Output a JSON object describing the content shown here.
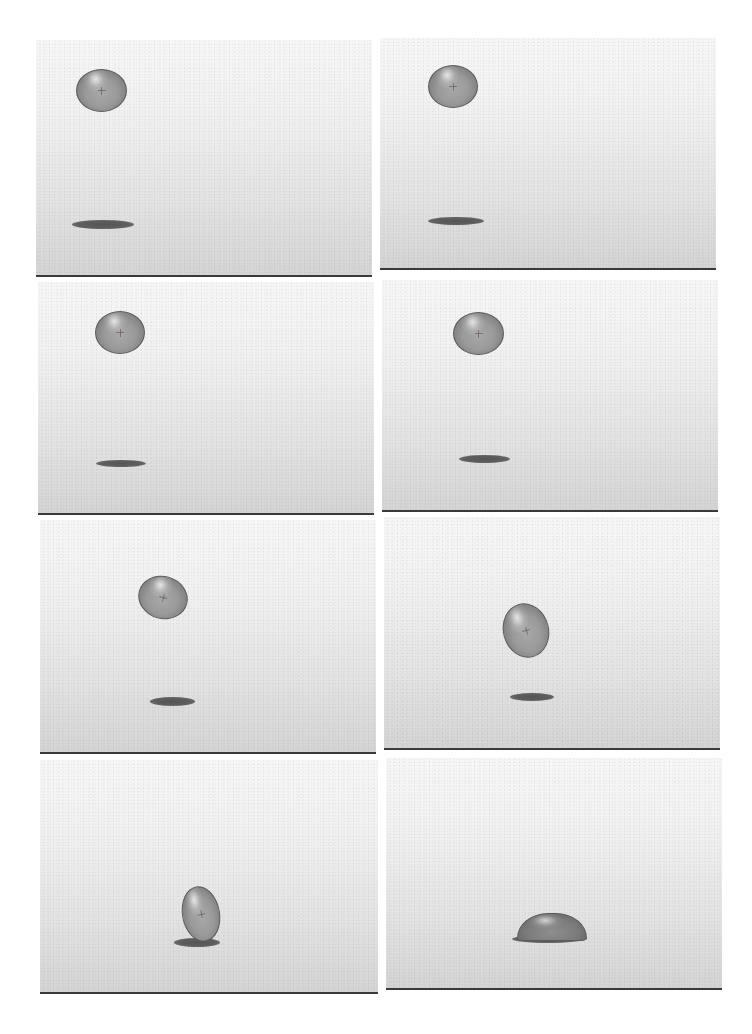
{
  "figure": {
    "layout": {
      "rows": 4,
      "columns": 2
    },
    "colors": {
      "background_top": "#f6f6f6",
      "background_bottom": "#d4d4d4",
      "ground_line": "#3a3a3a",
      "droplet_fill": "#9a9a9a",
      "droplet_edge": "#5a5a5a",
      "shadow": "#5e5e5e"
    },
    "panels": [
      {
        "frame": 1,
        "box": {
          "left": 36,
          "top": 40,
          "width": 336,
          "height": 237
        },
        "droplet": {
          "x": 40,
          "y": 29,
          "w": 51,
          "h": 43,
          "rotate": 0,
          "shape": "ellipse"
        },
        "shadow": {
          "x": 36,
          "y": 180,
          "w": 62,
          "h": 9
        }
      },
      {
        "frame": 2,
        "box": {
          "left": 380,
          "top": 38,
          "width": 336,
          "height": 232
        },
        "droplet": {
          "x": 48,
          "y": 27,
          "w": 50,
          "h": 43,
          "rotate": 0,
          "shape": "ellipse"
        },
        "shadow": {
          "x": 48,
          "y": 179,
          "w": 56,
          "h": 8
        }
      },
      {
        "frame": 3,
        "box": {
          "left": 38,
          "top": 282,
          "width": 336,
          "height": 233
        },
        "droplet": {
          "x": 57,
          "y": 29,
          "w": 50,
          "h": 43,
          "rotate": 0,
          "shape": "ellipse"
        },
        "shadow": {
          "x": 58,
          "y": 178,
          "w": 50,
          "h": 7
        }
      },
      {
        "frame": 4,
        "box": {
          "left": 382,
          "top": 280,
          "width": 336,
          "height": 232
        },
        "droplet": {
          "x": 71,
          "y": 32,
          "w": 51,
          "h": 43,
          "rotate": 0,
          "shape": "ellipse"
        },
        "shadow": {
          "x": 77,
          "y": 175,
          "w": 51,
          "h": 8
        }
      },
      {
        "frame": 5,
        "box": {
          "left": 40,
          "top": 520,
          "width": 336,
          "height": 234
        },
        "droplet": {
          "x": 98,
          "y": 56,
          "w": 50,
          "h": 43,
          "rotate": 15,
          "shape": "ellipse"
        },
        "shadow": {
          "x": 110,
          "y": 177,
          "w": 45,
          "h": 9
        }
      },
      {
        "frame": 6,
        "box": {
          "left": 384,
          "top": 517,
          "width": 336,
          "height": 233
        },
        "droplet": {
          "x": 119,
          "y": 86,
          "w": 46,
          "h": 55,
          "rotate": -15,
          "shape": "ellipse"
        },
        "shadow": {
          "x": 126,
          "y": 176,
          "w": 44,
          "h": 8
        }
      },
      {
        "frame": 7,
        "box": {
          "left": 40,
          "top": 760,
          "width": 338,
          "height": 234
        },
        "droplet": {
          "x": 142,
          "y": 126,
          "w": 38,
          "h": 56,
          "rotate": -10,
          "shape": "ellipse"
        },
        "shadow": {
          "x": 134,
          "y": 178,
          "w": 46,
          "h": 9
        }
      },
      {
        "frame": 8,
        "box": {
          "left": 386,
          "top": 758,
          "width": 336,
          "height": 232
        },
        "droplet": {
          "x": 131,
          "y": 155,
          "w": 70,
          "h": 28,
          "rotate": 0,
          "shape": "spread"
        },
        "shadow": {
          "x": 126,
          "y": 177,
          "w": 72,
          "h": 8
        }
      }
    ]
  }
}
